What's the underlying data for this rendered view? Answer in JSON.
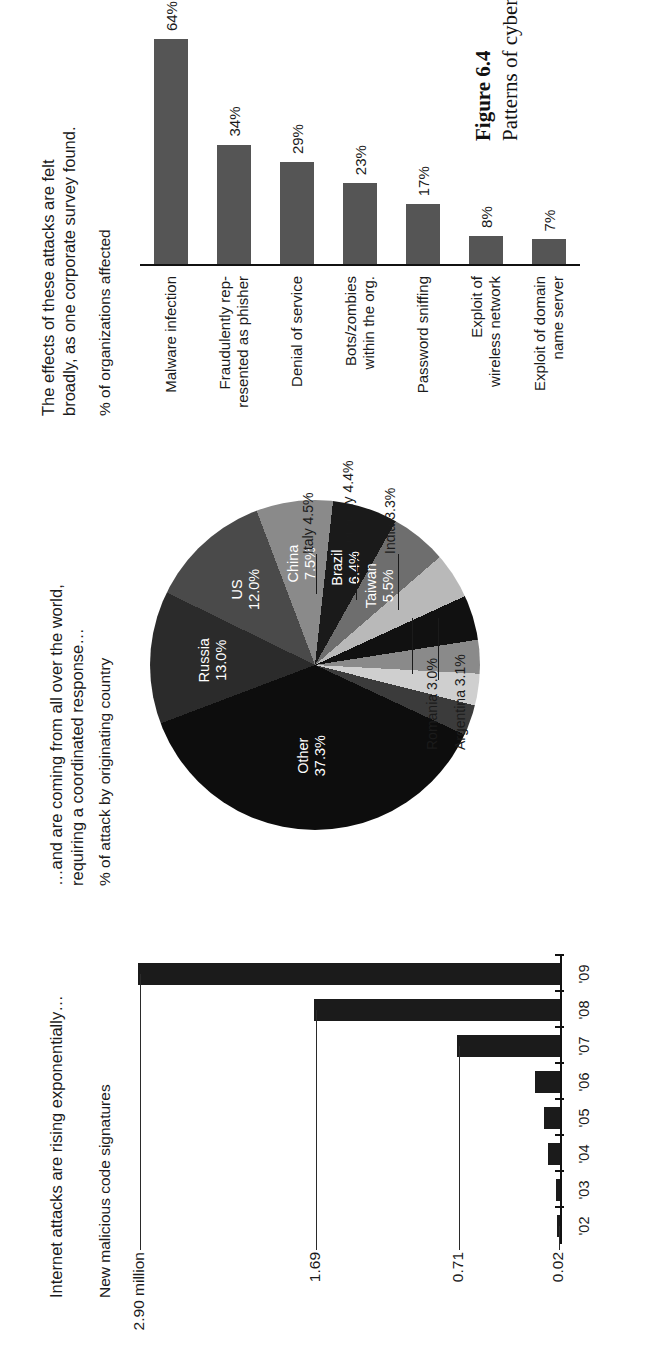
{
  "caption": {
    "label": "Figure 6.4",
    "text": "Patterns of cyber threats."
  },
  "panels": {
    "signatures": {
      "headline": "Internet attacks are rising exponentially…",
      "axis_title": "New malicious code signatures",
      "value_labels": [
        "2.90 million",
        "1.69",
        "0.71",
        "0.02"
      ]
    },
    "origin": {
      "headline_line1": "…and are coming from all over the world,",
      "headline_line2": "requiring a coordinated response…",
      "axis_title": "% of attack by originating country"
    },
    "effects": {
      "headline_line1": "The effects of these attacks are felt",
      "headline_line2": "broadly, as one corporate survey found.",
      "axis_title": "% of organizations affected"
    }
  },
  "chart_data": [
    {
      "type": "bar",
      "title": "New malicious code signatures",
      "subtitle": "Internet attacks are rising exponentially…",
      "xlabel": "",
      "ylabel": "New malicious code signatures",
      "categories": [
        "'02",
        "'03",
        "'04",
        "'05",
        "'06",
        "'07",
        "'08",
        "'09"
      ],
      "values": [
        0.02,
        0.03,
        0.08,
        0.11,
        0.17,
        0.71,
        1.69,
        2.9
      ],
      "unit": "million",
      "ylim": [
        0,
        2.9
      ],
      "grid": false,
      "annotations": [
        {
          "text": "2.90 million",
          "value": 2.9
        },
        {
          "text": "1.69",
          "value": 1.69
        },
        {
          "text": "0.71",
          "value": 0.71
        },
        {
          "text": "0.02",
          "value": 0.02
        }
      ]
    },
    {
      "type": "pie",
      "title": "% of attack by originating country",
      "subtitle": "…and are coming from all over the world, requiring a coordinated response…",
      "labels": [
        "Other",
        "Russia",
        "US",
        "China",
        "Brazil",
        "Taiwan",
        "Italy",
        "Germany",
        "India",
        "Argentina",
        "Romania"
      ],
      "values": [
        37.3,
        13.0,
        12.0,
        7.5,
        6.4,
        5.5,
        4.5,
        4.4,
        3.3,
        3.1,
        3.0
      ],
      "display_labels": [
        "Other\n37.3%",
        "Russia\n13.0%",
        "US\n12.0%",
        "China\n7.5%",
        "Brazil\n6.4%",
        "Taiwan\n5.5%",
        "Italy 4.5%",
        "Germany 4.4%",
        "India 3.3%",
        "Argentina 3.1%",
        "Romania 3.0%"
      ],
      "colors": [
        "#0d0d0d",
        "#2b2b2b",
        "#4a4a4a",
        "#8a8a8a",
        "#1a1a1a",
        "#6e6e6e",
        "#b9b9b9",
        "#111111",
        "#8a8a8a",
        "#cfcfcf",
        "#3b3b3b"
      ],
      "legend": "none"
    },
    {
      "type": "bar",
      "orientation": "horizontal",
      "title": "% of organizations affected",
      "subtitle": "The effects of these attacks are felt broadly, as one corporate survey found.",
      "xlabel": "% of organizations affected",
      "ylabel": "",
      "categories": [
        "Malware infection",
        "Fraudulently rep-\nresented as phisher",
        "Denial of service",
        "Bots/zombies\nwithin the org.",
        "Password sniffing",
        "Exploit of\nwireless network",
        "Exploit of domain\nname  server"
      ],
      "values": [
        64,
        34,
        29,
        23,
        17,
        8,
        7
      ],
      "value_labels": [
        "64%",
        "34%",
        "29%",
        "23%",
        "17%",
        "8%",
        "7%"
      ],
      "xlim": [
        0,
        70
      ],
      "grid": false,
      "bar_color": "#555555"
    }
  ]
}
